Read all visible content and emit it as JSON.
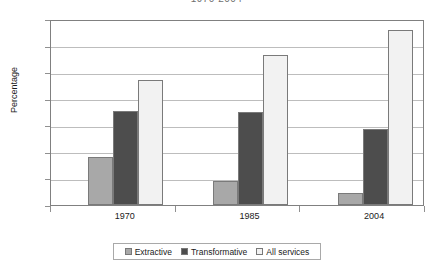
{
  "chart_data": {
    "type": "bar",
    "title": "1970-2004",
    "xlabel": "",
    "ylabel": "Percentage",
    "ylim": [
      0,
      70
    ],
    "yticks": [
      0,
      10,
      20,
      30,
      40,
      50,
      60,
      70
    ],
    "grid": true,
    "legend_position": "bottom",
    "categories": [
      "1970",
      "1985",
      "2004"
    ],
    "series": [
      {
        "name": "Extractive",
        "color": "#a8a8a8",
        "values": [
          18,
          9,
          4.5
        ]
      },
      {
        "name": "Transformative",
        "color": "#4d4d4d",
        "values": [
          35.5,
          35,
          28.5
        ]
      },
      {
        "name": "All services",
        "color": "#f2f2f2",
        "values": [
          47,
          56.5,
          66
        ]
      }
    ]
  },
  "axis": {
    "y_title": "Percentage"
  }
}
